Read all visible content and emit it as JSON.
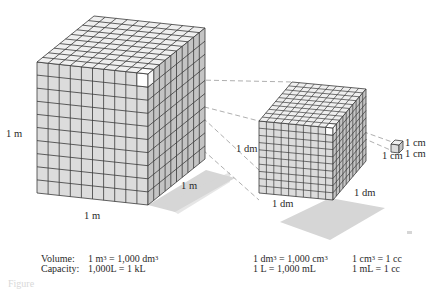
{
  "figure": {
    "cubes": [
      {
        "name": "cubic-meter",
        "divisions": 10,
        "edge_labels": {
          "height": "1 m",
          "width": "1 m",
          "depth": "1 m"
        }
      },
      {
        "name": "cubic-decimeter",
        "divisions": 10,
        "edge_labels": {
          "height": "1 dm",
          "width": "1 dm",
          "depth": "1 dm"
        }
      },
      {
        "name": "cubic-centimeter",
        "divisions": 1,
        "edge_labels": {
          "height": "1 cm",
          "width": "1 cm",
          "depth": "1 cm"
        }
      }
    ],
    "colors": {
      "face_front": "#dcdcdc",
      "face_top": "#efefef",
      "face_side": "#c4c4c4",
      "grid_line": "#3a3a3a",
      "shadow": "#d6d6d6",
      "dashed_line": "#9a9a9a"
    }
  },
  "labels": {
    "big_height": "1 m",
    "big_width": "1 m",
    "big_depth": "1 m",
    "mid_height": "1 dm",
    "mid_width": "1 dm",
    "mid_depth": "1 dm",
    "small_height": "1 cm",
    "small_width": "1 cm",
    "small_depth": "1 cm"
  },
  "equations": {
    "volume_label": "Volume:",
    "capacity_label": "Capacity:",
    "big_volume": {
      "lhs": "1 m",
      "mid": " = 1,000 dm",
      "sup": "3"
    },
    "big_capacity": "1,000L  = 1 kL",
    "mid_volume": {
      "lhs": "1 dm",
      "mid": " = 1,000 cm",
      "sup": "3"
    },
    "mid_capacity": "1 L  = 1,000 mL",
    "small_volume": {
      "lhs": "1 cm",
      "rhs": " = 1 cc",
      "sup": "3"
    },
    "small_capacity": "1 mL = 1 cc"
  },
  "caption": "Figure"
}
